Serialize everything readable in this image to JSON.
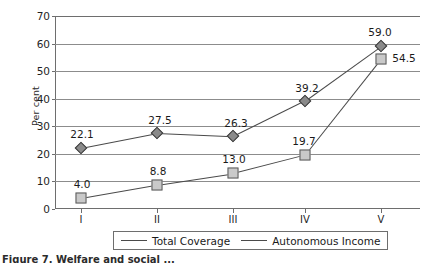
{
  "chart_data": {
    "type": "line",
    "title": "",
    "xlabel": "",
    "ylabel": "Per cent",
    "categories": [
      "I",
      "II",
      "III",
      "IV",
      "V"
    ],
    "ylim": [
      0,
      70
    ],
    "yticks": [
      0,
      10,
      20,
      30,
      40,
      50,
      60,
      70
    ],
    "grid": true,
    "legend_position": "bottom",
    "series": [
      {
        "name": "Total Coverage",
        "marker": "diamond",
        "values": [
          22.1,
          27.5,
          26.3,
          39.2,
          59.0
        ],
        "labels": [
          "22.1",
          "27.5",
          "26.3",
          "39.2",
          "59.0"
        ]
      },
      {
        "name": "Autonomous Income",
        "marker": "square",
        "values": [
          4.0,
          8.8,
          13.0,
          19.7,
          54.5
        ],
        "labels": [
          "4.0",
          "8.8",
          "13.0",
          "19.7",
          "54.5"
        ]
      }
    ]
  },
  "axis": {
    "y_tick_labels": [
      "70",
      "60",
      "50",
      "40",
      "30",
      "20",
      "10",
      "0"
    ],
    "x_tick_labels": [
      "I",
      "II",
      "III",
      "IV",
      "V"
    ],
    "y_axis_title": "Per cent"
  },
  "legend": {
    "items": [
      {
        "label": "Total Coverage",
        "marker": "diamond"
      },
      {
        "label": "Autonomous Income",
        "marker": "square"
      }
    ]
  },
  "caption": {
    "text": "Figure 7. Welfare and social ..."
  },
  "colors": {
    "series_line": "#4a4a4a",
    "diamond_fill": "#8a8a8a",
    "square_fill": "#c9c9c9",
    "gridline": "#8c8c8c",
    "axis": "#6e6e6e",
    "text": "#1a1a1a"
  }
}
